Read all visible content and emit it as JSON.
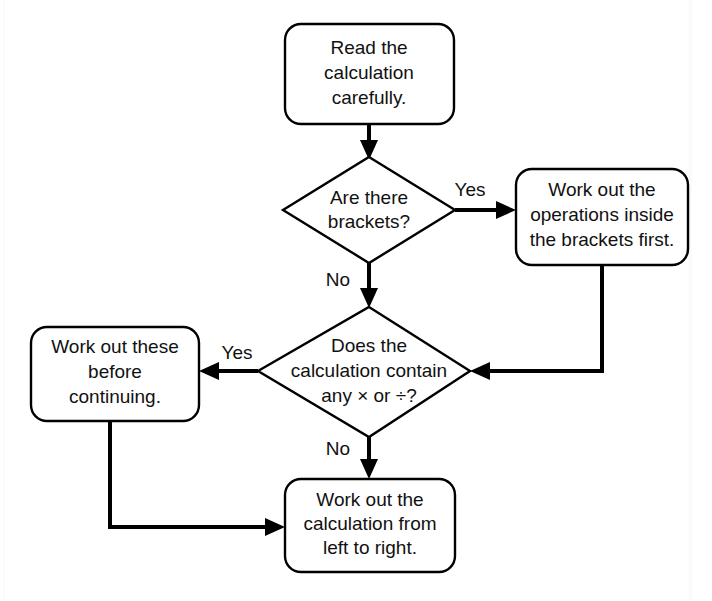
{
  "diagram": {
    "type": "flowchart",
    "background_color": "#ffffff",
    "stroke_color": "#000000",
    "text_color": "#111111"
  },
  "nodes": {
    "start": {
      "shape": "rounded-rectangle",
      "lines": [
        "Read the",
        "calculation",
        "carefully."
      ]
    },
    "brackets_decision": {
      "shape": "diamond",
      "lines": [
        "Are there",
        "brackets?"
      ]
    },
    "brackets_action": {
      "shape": "rounded-rectangle",
      "lines": [
        "Work out the",
        "operations inside",
        "the brackets first."
      ]
    },
    "mul_div_decision": {
      "shape": "diamond",
      "lines": [
        "Does the",
        "calculation contain",
        "any × or ÷?"
      ]
    },
    "mul_div_action": {
      "shape": "rounded-rectangle",
      "lines": [
        "Work out these",
        "before",
        "continuing."
      ]
    },
    "left_to_right_action": {
      "shape": "rounded-rectangle",
      "lines": [
        "Work out the",
        "calculation from",
        "left to right."
      ]
    }
  },
  "edge_labels": {
    "brackets_yes": "Yes",
    "brackets_no": "No",
    "mul_div_yes": "Yes",
    "mul_div_no": "No"
  }
}
